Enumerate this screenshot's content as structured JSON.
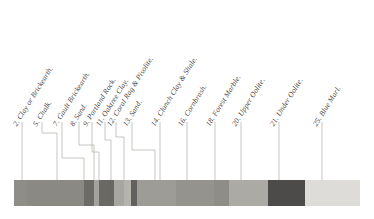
{
  "figure": {
    "kind": "stratigraphic-section-key",
    "background_color": "#ffffff",
    "label_color": "#4a4742",
    "leader_color": "#b9b6b0",
    "bar": {
      "x": 14,
      "y": 180,
      "width": 346,
      "height": 26,
      "border_color": "#c9c6c0"
    }
  },
  "strata": [
    {
      "number": "2.",
      "name": "Clay or Brickearth.",
      "label": "2. Clay or Brickearth.",
      "label_x": 18,
      "label_y": 120,
      "tick_x": 22,
      "leader": [
        [
          22,
          122
        ],
        [
          22,
          180
        ]
      ],
      "color": "#8d8b86",
      "band_x": 14,
      "band_width": 13
    },
    {
      "number": "5.",
      "name": "Chalk.",
      "label": "5. Chalk.",
      "label_x": 38,
      "label_y": 120,
      "tick_x": 42,
      "leader": [
        [
          42,
          122
        ],
        [
          42,
          133
        ],
        [
          57,
          133
        ],
        [
          57,
          180
        ]
      ],
      "color": "#8a8883",
      "band_x": 27,
      "band_width": 57
    },
    {
      "number": "7.",
      "name": "Gault Brickearth.",
      "label": "7. Gault Brickearth.",
      "label_x": 58,
      "label_y": 120,
      "tick_x": 62,
      "leader": [
        [
          62,
          122
        ],
        [
          62,
          158
        ],
        [
          84,
          158
        ],
        [
          84,
          180
        ]
      ],
      "color": "#6e6c68",
      "band_x": 84,
      "band_width": 10
    },
    {
      "number": "8.",
      "name": "Sand.",
      "label": "8. Sand.",
      "label_x": 75,
      "label_y": 120,
      "tick_x": 79,
      "leader": [
        [
          79,
          122
        ],
        [
          79,
          145
        ],
        [
          94,
          145
        ],
        [
          94,
          180
        ]
      ],
      "color": "#a3a19c",
      "band_x": 94,
      "band_width": 5
    },
    {
      "number": "9.",
      "name": "Portland Rock.",
      "label": "9. Portland Rock.",
      "label_x": 88,
      "label_y": 120,
      "tick_x": 92,
      "leader": [
        [
          92,
          122
        ],
        [
          92,
          152
        ],
        [
          99,
          152
        ],
        [
          99,
          180
        ]
      ],
      "color": "#6a6864",
      "band_x": 99,
      "band_width": 8
    },
    {
      "number": "11.",
      "name": "Oaktree Clay.",
      "label": "11. Oaktree Clay.",
      "label_x": 101,
      "label_y": 120,
      "tick_x": 105,
      "leader": [
        [
          105,
          122
        ],
        [
          105,
          140
        ],
        [
          111,
          140
        ],
        [
          111,
          180
        ]
      ],
      "color": "#6b6965",
      "band_x": 107,
      "band_width": 7
    },
    {
      "number": "12.",
      "name": "Coral Rag & Pisolite.",
      "label": "12. Coral Rag & Pisolite.",
      "label_x": 112,
      "label_y": 120,
      "tick_x": 116,
      "leader": [
        [
          116,
          122
        ],
        [
          116,
          137
        ],
        [
          124,
          137
        ],
        [
          124,
          180
        ]
      ],
      "color": "#a6a49f",
      "band_x": 114,
      "band_width": 10
    },
    {
      "number": "13.",
      "name": "Sand.",
      "label": "13. Sand.",
      "label_x": 128,
      "label_y": 120,
      "tick_x": 132,
      "leader": [
        [
          132,
          122
        ],
        [
          132,
          150
        ],
        [
          155,
          150
        ],
        [
          155,
          180
        ]
      ],
      "color": "#b3b1ac",
      "band_x": 124,
      "band_width": 7
    },
    {
      "number": "14.",
      "name": "Clunch Clay & Shale.",
      "label": "14. Clunch Clay & Shale.",
      "label_x": 156,
      "label_y": 120,
      "tick_x": 160,
      "leader": [
        [
          160,
          122
        ],
        [
          160,
          180
        ]
      ],
      "color": "#636160",
      "band_x": 131,
      "band_width": 6
    },
    {
      "number": "16.",
      "name": "Cornbrash.",
      "label": "16. Cornbrash.",
      "label_x": 183,
      "label_y": 120,
      "tick_x": 187,
      "leader": [
        [
          187,
          122
        ],
        [
          187,
          180
        ]
      ],
      "color": "#9d9b96",
      "band_x": 137,
      "band_width": 39
    },
    {
      "number": "18.",
      "name": "Forest Marble.",
      "label": "18. Forest Marble.",
      "label_x": 211,
      "label_y": 120,
      "tick_x": 215,
      "leader": [
        [
          215,
          122
        ],
        [
          215,
          180
        ]
      ],
      "color": "#94928d",
      "band_x": 176,
      "band_width": 38
    },
    {
      "number": "20.",
      "name": "Upper Oolite.",
      "label": "20. Upper Oolite.",
      "label_x": 237,
      "label_y": 120,
      "tick_x": 241,
      "leader": [
        [
          241,
          122
        ],
        [
          241,
          180
        ]
      ],
      "color": "#8e8c87",
      "band_x": 214,
      "band_width": 15
    },
    {
      "number": "21.",
      "name": "Under Oolite.",
      "label": "21. Under Oolite.",
      "label_x": 275,
      "label_y": 120,
      "tick_x": 279,
      "leader": [
        [
          279,
          122
        ],
        [
          279,
          180
        ]
      ],
      "color": "#a9a7a2",
      "band_x": 229,
      "band_width": 39
    },
    {
      "number": "25.",
      "name": "Blue Marl.",
      "label": "25. Blue Marl.",
      "label_x": 318,
      "label_y": 120,
      "tick_x": 322,
      "leader": [
        [
          322,
          122
        ],
        [
          322,
          180
        ]
      ],
      "color": "#4d4b49",
      "band_x": 268,
      "band_width": 37
    }
  ],
  "bands": [
    {
      "name": "clay-or-brickearth",
      "color": "#8f8d88",
      "width": 13
    },
    {
      "name": "chalk",
      "color": "#8b8984",
      "width": 57
    },
    {
      "name": "gault-brickearth",
      "color": "#6d6b67",
      "width": 10
    },
    {
      "name": "sand-8",
      "color": "#a5a39e",
      "width": 5
    },
    {
      "name": "portland-rock",
      "color": "#6b6965",
      "width": 8
    },
    {
      "name": "oaktree-clay",
      "color": "#6a6864",
      "width": 7
    },
    {
      "name": "coral-rag-pisolite",
      "color": "#a8a6a1",
      "width": 10
    },
    {
      "name": "sand-13",
      "color": "#b5b3ae",
      "width": 7
    },
    {
      "name": "clunch-clay-shale",
      "color": "#636160",
      "width": 6
    },
    {
      "name": "cornbrash",
      "color": "#9e9c97",
      "width": 39
    },
    {
      "name": "forest-marble",
      "color": "#95938e",
      "width": 38
    },
    {
      "name": "upper-oolite",
      "color": "#8f8d88",
      "width": 15
    },
    {
      "name": "under-oolite",
      "color": "#abaaa5",
      "width": 39
    },
    {
      "name": "blue-marl",
      "color": "#4d4b49",
      "width": 37
    },
    {
      "name": "terminal-light",
      "color": "#dedcd8",
      "width": 55
    }
  ]
}
